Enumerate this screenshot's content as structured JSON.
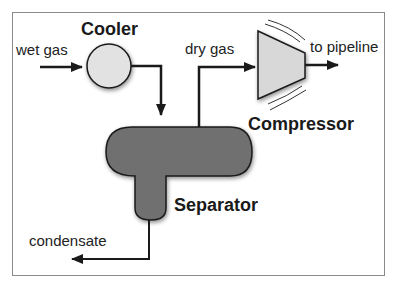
{
  "diagram": {
    "units": {
      "cooler": "Cooler",
      "separator": "Separator",
      "compressor": "Compressor"
    },
    "streams": {
      "wet_gas": "wet gas",
      "dry_gas": "dry gas",
      "to_pipeline": "to pipeline",
      "condensate": "condensate"
    },
    "colors": {
      "frame": "#888888",
      "cooler_fill": "#e0e0e0",
      "compressor_fill": "#d6d6d6",
      "separator_fill": "#6e6e6e",
      "lines": "#1a1a1a"
    }
  }
}
